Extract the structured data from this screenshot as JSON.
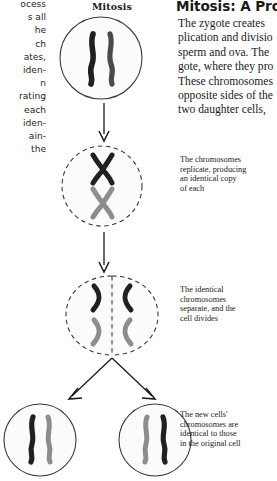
{
  "diagram": {
    "title": "Mitosis",
    "stages": [
      {
        "name": "parent-cell",
        "membrane": "solid",
        "chromosomes": "two-dark-rods"
      },
      {
        "name": "replicated-cell",
        "membrane": "dashed",
        "chromosomes": "two-x-shapes"
      },
      {
        "name": "dividing-cell",
        "membrane": "dashed-split",
        "chromosomes": "separated-pairs"
      },
      {
        "name": "daughter-cell-left",
        "membrane": "solid",
        "chromosomes": "dark-and-gray-rod"
      },
      {
        "name": "daughter-cell-right",
        "membrane": "solid",
        "chromosomes": "dark-and-gray-rod"
      }
    ],
    "colors": {
      "chromosome_dark": "#231f20",
      "chromosome_gray": "#8d8d8d",
      "membrane": "#3a3a3a",
      "cytoplasm": "#fbfbfb",
      "arrow": "#1a1a1a"
    }
  },
  "captions": {
    "one": [
      "The chromosomes",
      "replicate, producing",
      "an identical copy",
      "of each"
    ],
    "two": [
      "The identical",
      "chromosomes",
      "separate, and the",
      "cell divides"
    ],
    "three": [
      "The new cells'",
      "chromosomes are",
      "identical to those",
      "in the original cell"
    ]
  },
  "left_column": {
    "lines": [
      "ocess",
      "s all",
      "he",
      "ch",
      "ates,",
      "iden-",
      "n",
      "rating",
      "each",
      "iden-",
      "ain-",
      "the"
    ]
  },
  "right_column": {
    "headline": "Mitosis: A Proc",
    "paragraph": [
      "The zygote creates",
      "plication and divisio",
      "sperm and ova. The",
      "gote, where they pro",
      "These chromosomes",
      "opposite sides of the",
      "two daughter cells,"
    ]
  }
}
